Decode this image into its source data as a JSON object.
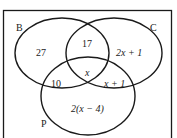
{
  "diagram": {
    "type": "venn",
    "sets": [
      {
        "name": "B",
        "label": "B"
      },
      {
        "name": "C",
        "label": "C"
      },
      {
        "name": "P",
        "label": "P"
      }
    ],
    "regions": {
      "B_only": "27",
      "B_and_C_only": "17",
      "C_only": "2x + 1",
      "B_and_P_only": "10",
      "B_C_P": "x",
      "C_and_P_only": "x + 1",
      "P_only": "2(x − 4)"
    },
    "colors": {
      "stroke": "#1a1a1a",
      "background": "#ffffff"
    }
  }
}
